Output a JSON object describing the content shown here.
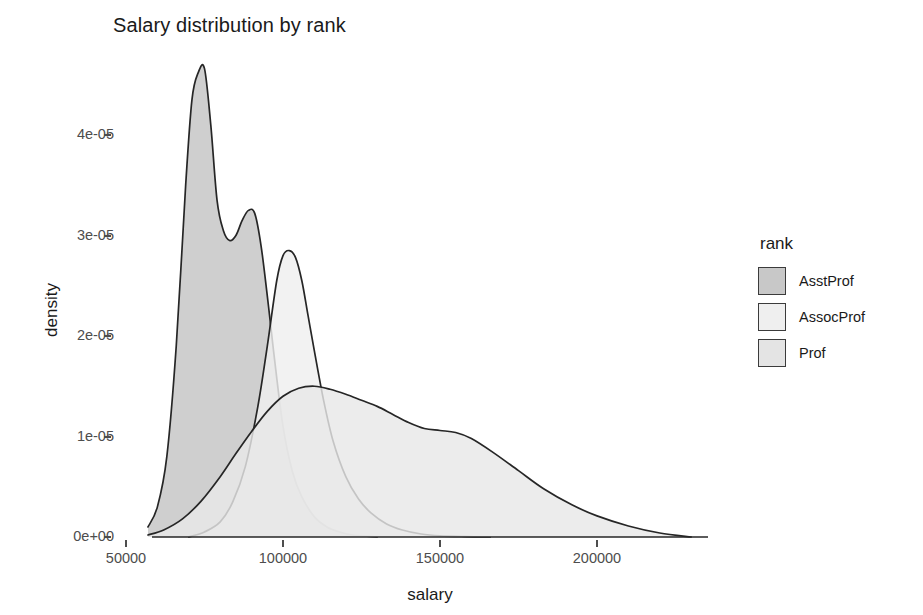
{
  "chart_data": {
    "type": "area",
    "title": "Salary distribution by rank",
    "xlabel": "salary",
    "ylabel": "density",
    "xlim": [
      57000,
      230000
    ],
    "ylim": [
      0,
      4.8e-05
    ],
    "grid": false,
    "legend_position": "right",
    "legend_title": "rank",
    "xticks": [
      50000,
      100000,
      150000,
      200000
    ],
    "xtick_labels": [
      "50000",
      "100000",
      "150000",
      "200000"
    ],
    "yticks": [
      0,
      1e-05,
      2e-05,
      3e-05,
      4e-05
    ],
    "ytick_labels": [
      "0e+00",
      "1e-05",
      "2e-05",
      "3e-05",
      "4e-05"
    ],
    "series": [
      {
        "name": "AsstProf",
        "fill": "#c4c4c4",
        "line": "#262626",
        "x": [
          57000,
          60000,
          63000,
          66000,
          69000,
          71000,
          73000,
          75000,
          77000,
          79000,
          81000,
          83000,
          85000,
          87000,
          89000,
          91000,
          93000,
          95000,
          97000,
          100000,
          103000,
          106000,
          110000,
          114000,
          118000,
          122000,
          126000,
          130000
        ],
        "y": [
          1e-06,
          3e-06,
          8e-06,
          1.9e-05,
          3.5e-05,
          4.35e-05,
          4.62e-05,
          4.66e-05,
          4.1e-05,
          3.35e-05,
          3.05e-05,
          2.95e-05,
          3e-05,
          3.15e-05,
          3.25e-05,
          3.22e-05,
          2.9e-05,
          2.4e-05,
          1.85e-05,
          1.1e-05,
          6.5e-06,
          4e-06,
          2e-06,
          1e-06,
          5e-07,
          2e-07,
          1e-07,
          0.0
        ]
      },
      {
        "name": "AssocProf",
        "fill": "#efefef",
        "line": "#262626",
        "x": [
          70000,
          75000,
          80000,
          84000,
          88000,
          92000,
          95000,
          98000,
          100000,
          102000,
          104000,
          106000,
          108000,
          110000,
          113000,
          116000,
          120000,
          124000,
          128000,
          133000,
          138000,
          144000,
          150000,
          158000,
          166000
        ],
        "y": [
          0.0,
          5e-07,
          1.5e-06,
          3.5e-06,
          7e-06,
          1.3e-05,
          1.9e-05,
          2.55e-05,
          2.8e-05,
          2.85e-05,
          2.78e-05,
          2.55e-05,
          2.2e-05,
          1.85e-05,
          1.35e-05,
          9.5e-06,
          6e-06,
          3.8e-06,
          2.4e-06,
          1.3e-06,
          7e-07,
          3e-07,
          1.2e-07,
          4e-08,
          0.0
        ]
      },
      {
        "name": "Prof",
        "fill": "#e8e8e8",
        "line": "#262626",
        "x": [
          57000,
          62000,
          68000,
          74000,
          80000,
          85000,
          90000,
          95000,
          100000,
          105000,
          110000,
          115000,
          120000,
          125000,
          130000,
          135000,
          140000,
          145000,
          150000,
          155000,
          160000,
          167000,
          175000,
          183000,
          192000,
          200000,
          210000,
          220000,
          230000
        ],
        "y": [
          2e-07,
          7e-07,
          1.8e-06,
          3.6e-06,
          6e-06,
          8.3e-06,
          1.05e-05,
          1.25e-05,
          1.4e-05,
          1.48e-05,
          1.5e-05,
          1.47e-05,
          1.42e-05,
          1.36e-05,
          1.3e-05,
          1.22e-05,
          1.14e-05,
          1.08e-05,
          1.06e-05,
          1.04e-05,
          9.8e-06,
          8.4e-06,
          6.6e-06,
          4.8e-06,
          3.2e-06,
          2.1e-06,
          1.1e-06,
          4e-07,
          0.0
        ]
      }
    ]
  },
  "legend": {
    "title": "rank",
    "items": [
      {
        "label": "AsstProf",
        "swatch": "#c8c8c8"
      },
      {
        "label": "AssocProf",
        "swatch": "#efefef"
      },
      {
        "label": "Prof",
        "swatch": "#e4e4e4"
      }
    ]
  },
  "colors": {
    "background": "#ffffff",
    "axis_text": "#4d4d4d",
    "title_text": "#1a1a1a",
    "curve_line": "#262626"
  }
}
